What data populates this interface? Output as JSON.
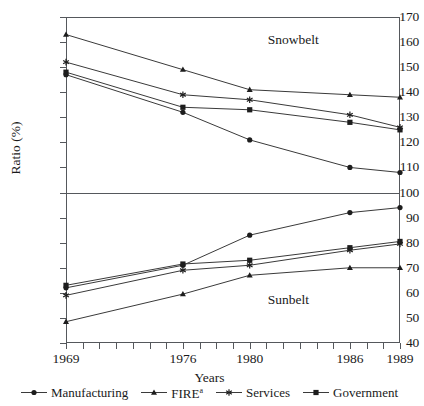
{
  "chart_data": {
    "type": "line",
    "title": "",
    "xlabel": "Years",
    "ylabel": "Ratio (%)",
    "x": [
      1969,
      1976,
      1980,
      1986,
      1989
    ],
    "xlim": [
      1969,
      1989
    ],
    "ylim": [
      40,
      170
    ],
    "yticks": [
      40,
      50,
      60,
      70,
      80,
      90,
      100,
      110,
      120,
      130,
      140,
      150,
      160,
      170
    ],
    "xticks_labeled": [
      1969,
      1976,
      1980,
      1986,
      1989
    ],
    "xticks_minor": [
      1969,
      1970,
      1971,
      1972,
      1973,
      1974,
      1975,
      1976,
      1977,
      1978,
      1979,
      1980,
      1981,
      1982,
      1983,
      1984,
      1985,
      1986,
      1987,
      1988,
      1989
    ],
    "grid": false,
    "reference_line": 100,
    "annotations": [
      {
        "text": "Snowbelt",
        "x": 1983,
        "y": 161
      },
      {
        "text": "Sunbelt",
        "x": 1983,
        "y": 57
      }
    ],
    "legend_position": "bottom",
    "panels": [
      {
        "name": "Snowbelt",
        "series": [
          {
            "name": "Manufacturing",
            "marker": "circle",
            "values": [
              147,
              132,
              121,
              110,
              108
            ]
          },
          {
            "name": "FIRE",
            "marker": "triangle",
            "values": [
              163,
              149,
              141,
              139,
              138
            ]
          },
          {
            "name": "Services",
            "marker": "star",
            "values": [
              152,
              139,
              137,
              131,
              126
            ]
          },
          {
            "name": "Government",
            "marker": "square",
            "values": [
              148,
              134,
              133,
              128,
              125
            ]
          }
        ]
      },
      {
        "name": "Sunbelt",
        "series": [
          {
            "name": "Manufacturing",
            "marker": "circle",
            "values": [
              62,
              71,
              83,
              92,
              94
            ]
          },
          {
            "name": "FIRE",
            "marker": "triangle",
            "values": [
              48.5,
              59.5,
              67,
              70,
              70
            ]
          },
          {
            "name": "Services",
            "marker": "star",
            "values": [
              59,
              69,
              71,
              77,
              79.5
            ]
          },
          {
            "name": "Government",
            "marker": "square",
            "values": [
              63,
              71.5,
              73,
              78,
              80.5
            ]
          }
        ]
      }
    ]
  },
  "axes": {
    "y_title": "Ratio (%)",
    "x_title": "Years",
    "y_labels": [
      "170",
      "160",
      "150",
      "140",
      "130",
      "120",
      "110",
      "100",
      "90",
      "80",
      "70",
      "60",
      "50",
      "40"
    ],
    "x_labels": [
      "1969",
      "1976",
      "1980",
      "1986",
      "1989"
    ]
  },
  "regions": {
    "snowbelt": "Snowbelt",
    "sunbelt": "Sunbelt"
  },
  "legend": {
    "items": [
      {
        "label": "Manufacturing",
        "marker": "circle-marker-icon"
      },
      {
        "label": "FIRE",
        "superscript": "a",
        "marker": "triangle-marker-icon"
      },
      {
        "label": "Services",
        "marker": "star-marker-icon"
      },
      {
        "label": "Government",
        "marker": "square-marker-icon"
      }
    ]
  },
  "colors": {
    "line": "#3a3a3a",
    "axis": "#55585c",
    "text": "#1a1a1a",
    "background": "#ffffff"
  }
}
